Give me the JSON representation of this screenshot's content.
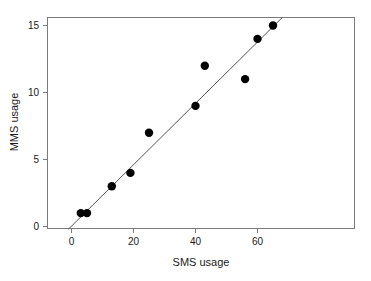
{
  "chart_data": {
    "type": "scatter",
    "title": "",
    "xlabel": "SMS usage",
    "ylabel": "MMS usage",
    "xlim": [
      -3,
      71
    ],
    "ylim": [
      -0.6,
      15.9
    ],
    "grid": false,
    "legend": null,
    "x_ticks": [
      0,
      20,
      40,
      60
    ],
    "x_tick_labels": [
      "0",
      "20",
      "40",
      "60"
    ],
    "y_ticks": [
      0,
      5,
      10,
      15
    ],
    "y_tick_labels": [
      "0",
      "5",
      "10",
      "15"
    ],
    "x": [
      3,
      5,
      13,
      19,
      25,
      40,
      43,
      56,
      60,
      65
    ],
    "y": [
      1,
      1,
      3,
      4,
      7,
      9,
      12,
      11,
      14,
      15
    ],
    "points": [
      {
        "x": 3,
        "y": 1
      },
      {
        "x": 5,
        "y": 1
      },
      {
        "x": 13,
        "y": 3
      },
      {
        "x": 19,
        "y": 4
      },
      {
        "x": 25,
        "y": 7
      },
      {
        "x": 40,
        "y": 9
      },
      {
        "x": 43,
        "y": 12
      },
      {
        "x": 56,
        "y": 11
      },
      {
        "x": 60,
        "y": 14
      },
      {
        "x": 65,
        "y": 15
      }
    ],
    "marker": {
      "shape": "circle",
      "size": 4.2,
      "color": "#000000"
    },
    "trendline": {
      "type": "linear-fit",
      "color": "#555555",
      "x_start": -1,
      "y_start": -0.2,
      "x_end": 68,
      "y_end": 15.6
    },
    "frame": {
      "color": "#7a7a7a",
      "top": true,
      "right": true,
      "bottom": true,
      "left": true
    }
  },
  "axes": {
    "x_title": "SMS usage",
    "y_title": "MMS usage"
  },
  "ticks": {
    "x": [
      "0",
      "20",
      "40",
      "60"
    ],
    "y": [
      "0",
      "5",
      "10",
      "15"
    ]
  }
}
